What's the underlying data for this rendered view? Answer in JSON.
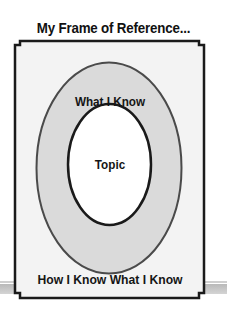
{
  "diagram": {
    "title": "My Frame of Reference...",
    "outer_label": "What I Know",
    "inner_label": "Topic",
    "frame_label": "How I Know What I Know",
    "colors": {
      "frame_fill": "#f3f3f3",
      "outer_ring_fill": "#dadada",
      "inner_fill": "#ffffff",
      "stroke": "#1a1a1a",
      "outer_stroke": "#4a4a4a",
      "band": "#c4c4c4"
    },
    "structure": [
      {
        "level": 1,
        "name": "How I Know What I Know",
        "shape": "frame"
      },
      {
        "level": 2,
        "name": "What I Know",
        "shape": "ellipse"
      },
      {
        "level": 3,
        "name": "Topic",
        "shape": "ellipse"
      }
    ]
  }
}
